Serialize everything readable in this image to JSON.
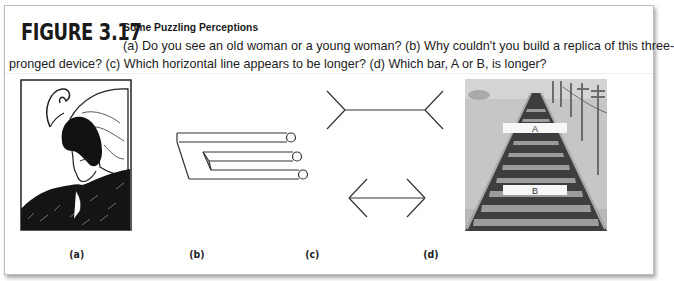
{
  "figure": {
    "number": "FIGURE 3.17",
    "title": "Some Puzzling Perceptions",
    "caption_line1": "(a) Do you see an old woman or a young woman? (b) Why couldn't you build a replica of this three-",
    "caption_line2": "pronged device? (c) Which horizontal line appears to be longer? (d) Which bar, A or B, is longer?"
  },
  "panels": [
    {
      "label": "(a)",
      "description": "old-woman-young-woman-illusion"
    },
    {
      "label": "(b)",
      "description": "impossible-trident"
    },
    {
      "label": "(c)",
      "description": "muller-lyer-illusion"
    },
    {
      "label": "(d)",
      "description": "ponzo-railroad-illusion",
      "bar_a": "A",
      "bar_b": "B"
    }
  ],
  "colors": {
    "text": "#1a1a1a",
    "border": "#bdbdbd",
    "sky": "#c9c9c9",
    "track_dark": "#4a4a4a",
    "track_light": "#9a9a9a",
    "bar_fill": "#f7f7f7"
  }
}
